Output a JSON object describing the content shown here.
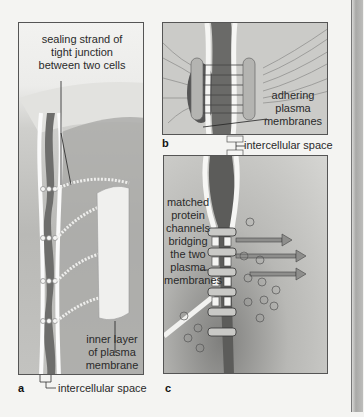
{
  "figure": {
    "panels": [
      {
        "id": "a",
        "label": "a",
        "description": "tight junction"
      },
      {
        "id": "b",
        "label": "b",
        "description": "adhering junction"
      },
      {
        "id": "c",
        "label": "c",
        "description": "gap junction"
      }
    ],
    "annotations": {
      "a_top_line1": "sealing strand of",
      "a_top_line2": "tight junction",
      "a_top_line3": "between two cells",
      "a_inner_line1": "inner layer",
      "a_inner_line2": "of plasma",
      "a_inner_line3": "membrane",
      "a_space": "intercellular space",
      "b_adhering_line1": "adhering",
      "b_adhering_line2": "plasma",
      "b_adhering_line3": "membranes",
      "b_space": "intercellular space",
      "c_line1": "matched",
      "c_line2": "protein",
      "c_line3": "channels",
      "c_line4": "bridging",
      "c_line5": "the two",
      "c_line6": "plasma",
      "c_line7": "membranes"
    },
    "colors": {
      "background": "#f4f4f2",
      "panel_fill": "#c9c9c6",
      "dark_membrane": "#6e6e6c",
      "border": "#555555"
    }
  }
}
